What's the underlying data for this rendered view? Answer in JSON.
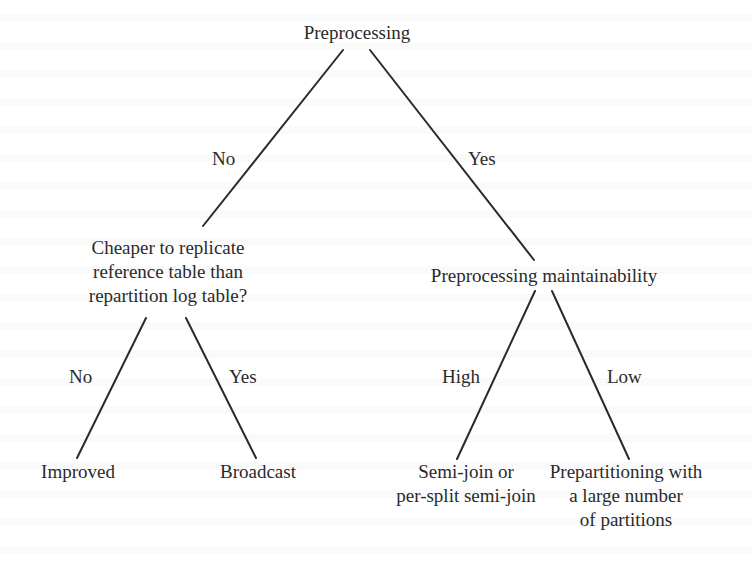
{
  "diagram": {
    "type": "decision-tree",
    "nodes": {
      "root": {
        "label": "Preprocessing"
      },
      "cheaper": {
        "lines": [
          "Cheaper to replicate",
          "reference table than",
          "repartition log table?"
        ]
      },
      "maintainability": {
        "label": "Preprocessing maintainability"
      },
      "improved": {
        "label": "Improved"
      },
      "broadcast": {
        "label": "Broadcast"
      },
      "semijoin": {
        "lines": [
          "Semi-join or",
          "per-split semi-join"
        ]
      },
      "prepartitioning": {
        "lines": [
          "Prepartitioning with",
          "a large number",
          "of partitions"
        ]
      }
    },
    "edges": {
      "root_no": {
        "from": "root",
        "to": "cheaper",
        "label": "No"
      },
      "root_yes": {
        "from": "root",
        "to": "maintainability",
        "label": "Yes"
      },
      "cheaper_no": {
        "from": "cheaper",
        "to": "improved",
        "label": "No"
      },
      "cheaper_yes": {
        "from": "cheaper",
        "to": "broadcast",
        "label": "Yes"
      },
      "maint_high": {
        "from": "maintainability",
        "to": "semijoin",
        "label": "High"
      },
      "maint_low": {
        "from": "maintainability",
        "to": "prepartitioning",
        "label": "Low"
      }
    },
    "colors": {
      "line": "#2a2a2a",
      "text": "#2a2a2a",
      "background": "#ffffff"
    }
  }
}
